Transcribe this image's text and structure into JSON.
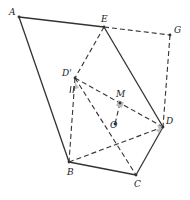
{
  "figure": {
    "type": "geometry",
    "stroke_color": "#333333",
    "points": [
      {
        "id": "A",
        "label": "A",
        "x": 19,
        "y": 17,
        "lx": 9,
        "ly": 15
      },
      {
        "id": "E",
        "label": "E",
        "x": 104,
        "y": 27,
        "lx": 101,
        "ly": 22
      },
      {
        "id": "G",
        "label": "G",
        "x": 170,
        "y": 35,
        "lx": 174,
        "ly": 33
      },
      {
        "id": "Dp",
        "label": "D'",
        "x": 75,
        "y": 78,
        "lx": 62,
        "ly": 76
      },
      {
        "id": "M",
        "label": "M",
        "x": 120,
        "y": 103,
        "lx": 116,
        "ly": 97
      },
      {
        "id": "O",
        "label": "O",
        "x": 115,
        "y": 124,
        "lx": 110,
        "ly": 128
      },
      {
        "id": "D",
        "label": "D",
        "x": 163,
        "y": 127,
        "lx": 166,
        "ly": 124
      },
      {
        "id": "B",
        "label": "B",
        "x": 69,
        "y": 162,
        "lx": 67,
        "ly": 175
      },
      {
        "id": "C",
        "label": "C",
        "x": 136,
        "y": 175,
        "lx": 134,
        "ly": 187
      }
    ],
    "solid_segments": [
      [
        "A",
        "E"
      ],
      [
        "A",
        "B"
      ],
      [
        "E",
        "D"
      ],
      [
        "D",
        "C"
      ],
      [
        "B",
        "C"
      ]
    ],
    "dashed_segments": [
      [
        "E",
        "G"
      ],
      [
        "G",
        "D"
      ],
      [
        "E",
        "Dp"
      ],
      [
        "Dp",
        "B"
      ],
      [
        "Dp",
        "D"
      ],
      [
        "Dp",
        "C"
      ],
      [
        "B",
        "D"
      ],
      [
        "M",
        "O"
      ]
    ]
  }
}
